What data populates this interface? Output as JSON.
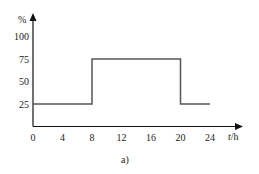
{
  "chart_data": {
    "type": "line",
    "step": true,
    "title": "",
    "caption": "a)",
    "xlabel": "t/h",
    "ylabel": "%",
    "xlim": [
      0,
      24
    ],
    "ylim": [
      0,
      100
    ],
    "xticks": [
      0,
      4,
      8,
      12,
      16,
      20,
      24
    ],
    "yticks": [
      25,
      50,
      75,
      100
    ],
    "grid": false,
    "legend": null,
    "series": [
      {
        "name": "load",
        "x": [
          0,
          8,
          8,
          20,
          20,
          24
        ],
        "y": [
          25,
          25,
          75,
          75,
          25,
          25
        ]
      }
    ]
  },
  "colors": {
    "axis": "#111111",
    "line": "#555555",
    "text": "#222222"
  }
}
